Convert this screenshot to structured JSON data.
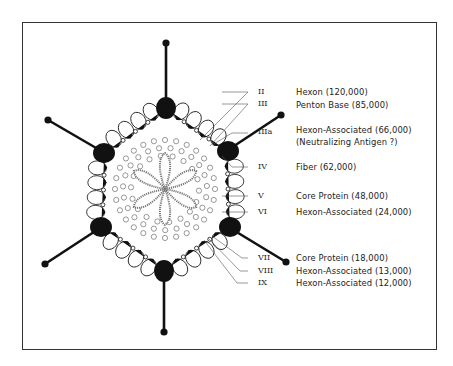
{
  "diagram": {
    "components": [
      {
        "numeral": "II",
        "label": "Hexon (120,000)"
      },
      {
        "numeral": "III",
        "label": "Penton Base (85,000)"
      },
      {
        "numeral": "IIIa",
        "label": "Hexon-Associated (66,000)",
        "label2": "(Neutralizing Antigen ?)"
      },
      {
        "numeral": "IV",
        "label": "Fiber (62,000)"
      },
      {
        "numeral": "V",
        "label": "Core Protein (48,000)"
      },
      {
        "numeral": "VI",
        "label": "Hexon-Associated (24,000)"
      },
      {
        "numeral": "VII",
        "label": "Core Protein (18,000)"
      },
      {
        "numeral": "VIII",
        "label": "Hexon-Associated (13,000)"
      },
      {
        "numeral": "IX",
        "label": "Hexon-Associated (12,000)"
      }
    ],
    "colors": {
      "ink": "#111111",
      "background": "#ffffff",
      "frame": "#333333"
    }
  }
}
